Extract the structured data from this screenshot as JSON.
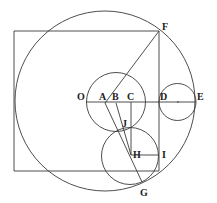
{
  "diagram": {
    "points": [
      "O",
      "A",
      "B",
      "C",
      "D",
      "E",
      "F",
      "G",
      "H",
      "I",
      "J"
    ],
    "labels": {
      "O": "O",
      "A": "A",
      "B": "B",
      "C": "C",
      "D": "D",
      "E": "E",
      "F": "F",
      "G": "G",
      "H": "H",
      "I": "I",
      "J": "J"
    },
    "segments": [
      [
        "O",
        "E"
      ],
      [
        "A",
        "F"
      ],
      [
        "A",
        "G"
      ],
      [
        "B",
        "H"
      ],
      [
        "C",
        "H"
      ],
      [
        "H",
        "I"
      ],
      [
        "F",
        "D"
      ]
    ],
    "circles": [
      {
        "name": "large-circle"
      },
      {
        "name": "circle-centered-B",
        "through": [
          "O",
          "C"
        ]
      },
      {
        "name": "circle-DE",
        "diameter": [
          "D",
          "E"
        ]
      },
      {
        "name": "circle-centered-H",
        "through": [
          "J",
          "I"
        ]
      }
    ],
    "line_color": "#3a3a3a"
  }
}
